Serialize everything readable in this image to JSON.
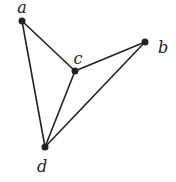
{
  "graph": {
    "vertices": [
      {
        "id": "a",
        "label": "a",
        "x": 22,
        "y": 21,
        "lx": 22,
        "ly": 13
      },
      {
        "id": "b",
        "label": "b",
        "x": 145,
        "y": 42,
        "lx": 163,
        "ly": 53
      },
      {
        "id": "c",
        "label": "c",
        "x": 75,
        "y": 71,
        "lx": 78,
        "ly": 64
      },
      {
        "id": "d",
        "label": "d",
        "x": 45,
        "y": 147,
        "lx": 42,
        "ly": 172
      }
    ],
    "edges": [
      [
        "a",
        "c"
      ],
      [
        "a",
        "d"
      ],
      [
        "c",
        "b"
      ],
      [
        "c",
        "d"
      ],
      [
        "b",
        "d"
      ]
    ],
    "colors": {
      "edge": "#222222",
      "vertex": "#222222",
      "background": "#ffffff"
    }
  }
}
